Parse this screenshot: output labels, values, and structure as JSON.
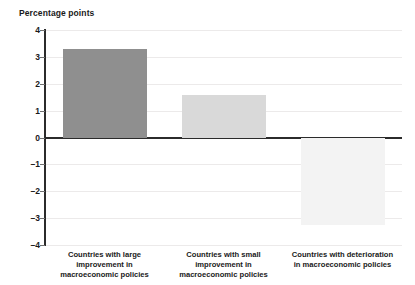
{
  "chart_data": {
    "type": "bar",
    "title": "",
    "ylabel": "Percentage points",
    "xlabel": "",
    "categories": [
      "Countries with large improvement in macroeconomic policies",
      "Countries with small improvement in macroeconomic policies",
      "Countries with deterioration in macroeconomic policies"
    ],
    "category_lines": [
      [
        "Countries with large",
        "improvement in",
        "macroeconomic policies"
      ],
      [
        "Countries with small",
        "improvement in",
        "macroeconomic policies"
      ],
      [
        "Countries with deterioration",
        "in macroeconomic policies"
      ]
    ],
    "values": [
      3.3,
      1.6,
      -3.25
    ],
    "bar_colors": [
      "#8f8f8f",
      "#d9d9d9",
      "#f3f3f3"
    ],
    "ylim": [
      -4,
      4
    ],
    "yticks": [
      4,
      3,
      2,
      1,
      0,
      -1,
      -2,
      -3,
      -4
    ],
    "ytick_labels": [
      "4",
      "3",
      "2",
      "1",
      "0",
      "–1",
      "–2",
      "–3",
      "–4"
    ],
    "grid": true,
    "legend": "none",
    "zero_line": true
  },
  "colors": {
    "axis": "#2b2b2b",
    "grid": "#eceaea",
    "text": "#1a1a1a",
    "background": "#ffffff"
  }
}
